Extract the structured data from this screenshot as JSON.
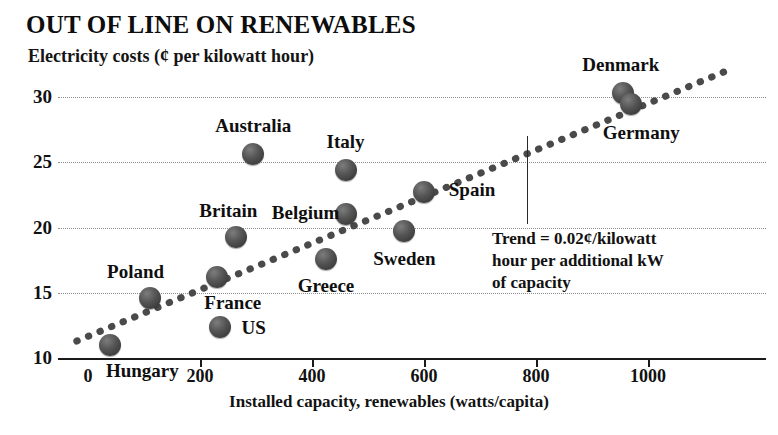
{
  "chart_data": {
    "type": "scatter",
    "title": "OUT OF LINE ON RENEWABLES",
    "subtitle": "Electricity costs (¢ per kilowatt hour)",
    "xlabel": "Installed capacity, renewables (watts/capita)",
    "ylabel": "Electricity costs (¢ per kilowatt hour)",
    "xlim": [
      -40,
      1160
    ],
    "ylim": [
      10,
      32
    ],
    "xticks": [
      0,
      200,
      400,
      600,
      800,
      1000
    ],
    "yticks": [
      10,
      15,
      20,
      25,
      30
    ],
    "grid": true,
    "legend": "none",
    "points": [
      {
        "label": "Hungary",
        "x": 40,
        "y": 11.0,
        "label_dx": 32,
        "label_dy": 26
      },
      {
        "label": "Poland",
        "x": 110,
        "y": 14.6,
        "label_dx": -14,
        "label_dy": -26
      },
      {
        "label": "France",
        "x": 230,
        "y": 16.2,
        "label_dx": 16,
        "label_dy": 26
      },
      {
        "label": "US",
        "x": 235,
        "y": 12.4,
        "label_dx": 34,
        "label_dy": 1
      },
      {
        "label": "Britain",
        "x": 265,
        "y": 19.3,
        "label_dx": -8,
        "label_dy": -26
      },
      {
        "label": "Australia",
        "x": 295,
        "y": 25.6,
        "label_dx": 0,
        "label_dy": -28
      },
      {
        "label": "Greece",
        "x": 425,
        "y": 17.6,
        "label_dx": 0,
        "label_dy": 27
      },
      {
        "label": "Belgium",
        "x": 460,
        "y": 21.0,
        "label_dx": -40,
        "label_dy": -1
      },
      {
        "label": "Italy",
        "x": 460,
        "y": 24.4,
        "label_dx": 0,
        "label_dy": -28
      },
      {
        "label": "Sweden",
        "x": 565,
        "y": 19.7,
        "label_dx": 0,
        "label_dy": 28
      },
      {
        "label": "Spain",
        "x": 600,
        "y": 22.7,
        "label_dx": 48,
        "label_dy": -2
      },
      {
        "label": "Denmark",
        "x": 955,
        "y": 30.3,
        "label_dx": -2,
        "label_dy": -28
      },
      {
        "label": "Germany",
        "x": 970,
        "y": 29.5,
        "label_dx": 10,
        "label_dy": 29
      }
    ],
    "trendline": {
      "equation_note": "Trend = 0.02¢/kilowatt hour per additional kW of capacity",
      "style": "dotted",
      "x_start": -20,
      "y_start": 11.3,
      "x_end": 1140,
      "y_end": 32.0
    }
  },
  "annotation": {
    "line1": "Trend = 0.02¢/kilowatt",
    "line2": "hour per additional kW",
    "line3": "of capacity"
  },
  "colors": {
    "marker": "#4a4a4a",
    "text": "#111111",
    "grid": "#8d8d8d",
    "axis": "#1a1a1a",
    "background": "#ffffff"
  }
}
